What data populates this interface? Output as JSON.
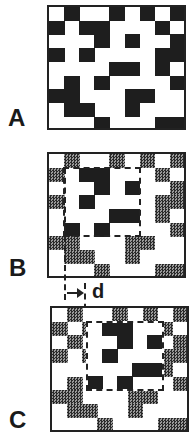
{
  "figure": {
    "labels": {
      "a": "A",
      "b": "B",
      "c": "C",
      "d": "d"
    },
    "cell_fill": {
      "black": "#1e1e1e",
      "gray_dither": "#6a6a6a",
      "white": "#ffffff"
    },
    "grid": {
      "rows": 9,
      "cols": 9
    },
    "pattern_a": [
      [
        0,
        1,
        0,
        0,
        1,
        0,
        1,
        0,
        1
      ],
      [
        1,
        0,
        1,
        1,
        0,
        0,
        0,
        1,
        0
      ],
      [
        0,
        0,
        0,
        1,
        0,
        1,
        0,
        0,
        1
      ],
      [
        1,
        0,
        1,
        0,
        0,
        0,
        0,
        1,
        1
      ],
      [
        0,
        0,
        0,
        0,
        1,
        1,
        0,
        1,
        0
      ],
      [
        0,
        1,
        0,
        1,
        0,
        0,
        0,
        0,
        1
      ],
      [
        1,
        1,
        0,
        0,
        0,
        1,
        1,
        0,
        0
      ],
      [
        0,
        1,
        1,
        0,
        0,
        1,
        0,
        0,
        0
      ],
      [
        0,
        0,
        0,
        1,
        0,
        0,
        0,
        1,
        1
      ]
    ],
    "panel_b_window": {
      "col_start": 1,
      "col_end": 5,
      "row_start": 1,
      "row_end": 5
    },
    "panel_c_left_strip": [
      [
        1,
        0
      ],
      [
        0,
        1
      ],
      [
        1,
        0
      ],
      [
        0,
        0
      ],
      [
        0,
        1
      ]
    ],
    "panel_c_window_shift_px": 20
  }
}
